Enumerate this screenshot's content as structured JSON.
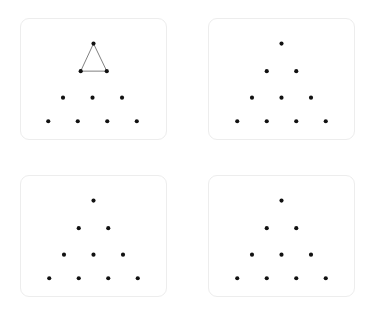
{
  "figure": {
    "title": "",
    "background_color": "#ffffff",
    "dot_color": "#111111",
    "edge_color": "#7d7d7d",
    "card_border_color": "#ededed",
    "card_background": "#ffffff",
    "panel_count": 4,
    "grid_rows": 2,
    "grid_cols": 2
  },
  "panels": [
    {
      "id": "panel-top-left",
      "label": "",
      "dot_count": 10,
      "row_counts": [
        1,
        2,
        3,
        4
      ],
      "has_triangle_overlay": true,
      "triangle_vertices": [
        [
          73.5,
          25.0
        ],
        [
          60.5,
          53.0
        ],
        [
          87.0,
          53.0
        ]
      ],
      "dots": [
        [
          73.5,
          25.0
        ],
        [
          60.5,
          53.0
        ],
        [
          87.0,
          53.0
        ],
        [
          42.5,
          80.0
        ],
        [
          72.5,
          80.0
        ],
        [
          102.5,
          80.0
        ],
        [
          27.5,
          104.0
        ],
        [
          57.5,
          104.0
        ],
        [
          87.5,
          104.0
        ],
        [
          117.5,
          104.0
        ]
      ]
    },
    {
      "id": "panel-top-right",
      "label": "",
      "dot_count": 10,
      "row_counts": [
        1,
        2,
        3,
        4
      ],
      "has_triangle_overlay": false,
      "triangle_vertices": [],
      "dots": [
        [
          73.5,
          25.0
        ],
        [
          58.5,
          53.0
        ],
        [
          88.5,
          53.0
        ],
        [
          43.5,
          80.0
        ],
        [
          73.5,
          80.0
        ],
        [
          103.5,
          80.0
        ],
        [
          28.5,
          104.0
        ],
        [
          58.5,
          104.0
        ],
        [
          88.5,
          104.0
        ],
        [
          118.5,
          104.0
        ]
      ]
    },
    {
      "id": "panel-bottom-left",
      "label": "",
      "dot_count": 10,
      "row_counts": [
        1,
        2,
        3,
        4
      ],
      "has_triangle_overlay": false,
      "triangle_vertices": [],
      "dots": [
        [
          73.5,
          25.0
        ],
        [
          58.5,
          53.0
        ],
        [
          88.5,
          53.0
        ],
        [
          43.5,
          80.0
        ],
        [
          73.5,
          80.0
        ],
        [
          103.5,
          80.0
        ],
        [
          28.5,
          104.0
        ],
        [
          58.5,
          104.0
        ],
        [
          88.5,
          104.0
        ],
        [
          118.5,
          104.0
        ]
      ]
    },
    {
      "id": "panel-bottom-right",
      "label": "",
      "dot_count": 10,
      "row_counts": [
        1,
        2,
        3,
        4
      ],
      "has_triangle_overlay": false,
      "triangle_vertices": [],
      "dots": [
        [
          73.5,
          25.0
        ],
        [
          58.5,
          53.0
        ],
        [
          88.5,
          53.0
        ],
        [
          43.5,
          80.0
        ],
        [
          73.5,
          80.0
        ],
        [
          103.5,
          80.0
        ],
        [
          28.5,
          104.0
        ],
        [
          58.5,
          104.0
        ],
        [
          88.5,
          104.0
        ],
        [
          118.5,
          104.0
        ]
      ]
    }
  ],
  "geometry": {
    "dot_radius": 2.1,
    "card_width": 147,
    "card_height": 122,
    "card_corner_radius": 9
  }
}
